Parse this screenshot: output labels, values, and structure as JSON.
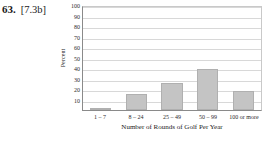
{
  "problem": {
    "number": "63.",
    "reference": "[7.3b]"
  },
  "chart_data": {
    "type": "bar",
    "title": "",
    "xlabel": "Number of Rounds of Golf Per Year",
    "ylabel": "Percent",
    "categories": [
      "1 – 7",
      "8 – 24",
      "25 – 49",
      "50 – 99",
      "100 or more"
    ],
    "values": [
      2,
      15,
      26,
      39,
      18
    ],
    "ylim": [
      0,
      100
    ],
    "yticks": [
      0,
      10,
      20,
      30,
      40,
      50,
      60,
      70,
      80,
      90,
      100
    ],
    "ytick_labels": [
      "0",
      "10",
      "20",
      "30",
      "40",
      "50",
      "60",
      "70",
      "80",
      "90",
      "100"
    ],
    "grid": true,
    "legend": "none",
    "bar_color": "#c4c4c4",
    "grid_color": "#d8d8d8",
    "axis_color": "#8a8a8a"
  }
}
